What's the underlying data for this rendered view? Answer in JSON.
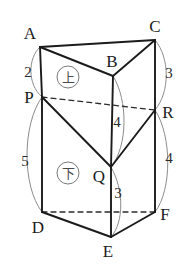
{
  "figure": {
    "kind": "triangular-prism-diagram",
    "stroke_color": "#1b1b1b",
    "arc_color": "#8c8c8c",
    "dashed_color": "#2b2b2b",
    "background": "#ffffff",
    "vertices": [
      {
        "id": "A",
        "label": "A",
        "px": 40,
        "py": 47,
        "lx": 30,
        "ly": 33
      },
      {
        "id": "B",
        "label": "B",
        "px": 113,
        "py": 76,
        "lx": 112,
        "ly": 61
      },
      {
        "id": "C",
        "label": "C",
        "px": 155,
        "py": 40,
        "lx": 155,
        "ly": 26
      },
      {
        "id": "P",
        "label": "P",
        "px": 42,
        "py": 97,
        "lx": 29,
        "ly": 97
      },
      {
        "id": "Q",
        "label": "Q",
        "px": 111,
        "py": 167,
        "lx": 99,
        "ly": 176
      },
      {
        "id": "R",
        "label": "R",
        "px": 155,
        "py": 110,
        "lx": 168,
        "ly": 112
      },
      {
        "id": "D",
        "label": "D",
        "px": 42,
        "py": 212,
        "lx": 38,
        "ly": 227
      },
      {
        "id": "E",
        "label": "E",
        "px": 111,
        "py": 237,
        "lx": 108,
        "ly": 251
      },
      {
        "id": "F",
        "label": "F",
        "px": 155,
        "py": 212,
        "lx": 165,
        "ly": 214
      }
    ],
    "edge_labels": [
      {
        "id": "AP",
        "value": "2",
        "lx": 28,
        "ly": 72
      },
      {
        "id": "PD",
        "value": "5",
        "lx": 25,
        "ly": 161
      },
      {
        "id": "CR",
        "value": "3",
        "lx": 169,
        "ly": 73
      },
      {
        "id": "RF",
        "value": "4",
        "lx": 169,
        "ly": 158
      },
      {
        "id": "BQ",
        "value": "4",
        "lx": 117,
        "ly": 122
      },
      {
        "id": "QE",
        "value": "3",
        "lx": 118,
        "ly": 193
      }
    ],
    "face_tags": [
      {
        "id": "upper-solid",
        "glyph": "上",
        "cx": 68,
        "cy": 77
      },
      {
        "id": "lower-solid",
        "glyph": "下",
        "cx": 68,
        "cy": 173
      }
    ]
  }
}
